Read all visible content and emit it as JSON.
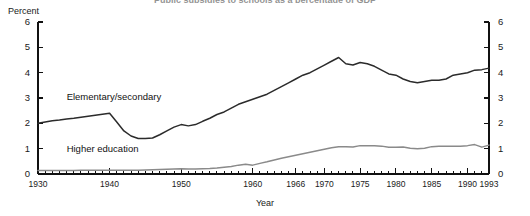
{
  "chart_data": {
    "type": "line",
    "title": "Public subsidies to schools as a percentage of GDP",
    "xlabel": "Year",
    "ylabel": "Percent",
    "ylim": [
      0,
      6
    ],
    "xlim": [
      1930,
      1993
    ],
    "grid": false,
    "legend_position": "inline-annotation",
    "yticks": [
      0,
      1,
      2,
      3,
      4,
      5,
      6
    ],
    "ytick_labels_left": [
      "0",
      "1",
      "2",
      "3",
      "4",
      "5",
      "6"
    ],
    "ytick_labels_right": [
      "0",
      "1",
      "2",
      "3",
      "4",
      "5",
      "6"
    ],
    "xticks": [
      1930,
      1940,
      1950,
      1960,
      1966,
      1970,
      1975,
      1980,
      1985,
      1990,
      1993
    ],
    "xtick_labels": [
      "1930",
      "1940",
      "1950",
      "1960",
      "1966",
      "1970",
      "1975",
      "1980",
      "1985",
      "1990",
      "1993"
    ],
    "x": [
      1930,
      1931,
      1932,
      1933,
      1934,
      1935,
      1936,
      1937,
      1938,
      1939,
      1940,
      1941,
      1942,
      1943,
      1944,
      1945,
      1946,
      1947,
      1948,
      1949,
      1950,
      1951,
      1952,
      1953,
      1954,
      1955,
      1956,
      1957,
      1958,
      1959,
      1960,
      1961,
      1962,
      1963,
      1964,
      1965,
      1966,
      1967,
      1968,
      1969,
      1970,
      1971,
      1972,
      1973,
      1974,
      1975,
      1976,
      1977,
      1978,
      1979,
      1980,
      1981,
      1982,
      1983,
      1984,
      1985,
      1986,
      1987,
      1988,
      1989,
      1990,
      1991,
      1992,
      1993
    ],
    "series": [
      {
        "name": "Elementary/secondary",
        "color": "#2b2b2b",
        "label_x": 1934,
        "label_y": 3.05,
        "values": [
          2.0,
          2.05,
          2.1,
          2.13,
          2.17,
          2.2,
          2.24,
          2.28,
          2.32,
          2.36,
          2.4,
          2.05,
          1.7,
          1.5,
          1.4,
          1.4,
          1.42,
          1.55,
          1.7,
          1.85,
          1.95,
          1.9,
          1.95,
          2.08,
          2.2,
          2.35,
          2.45,
          2.6,
          2.75,
          2.85,
          2.95,
          3.05,
          3.15,
          3.3,
          3.45,
          3.6,
          3.75,
          3.9,
          4.0,
          4.15,
          4.3,
          4.45,
          4.6,
          4.35,
          4.3,
          4.4,
          4.35,
          4.25,
          4.1,
          3.95,
          3.9,
          3.75,
          3.65,
          3.6,
          3.65,
          3.7,
          3.7,
          3.75,
          3.9,
          3.95,
          4.0,
          4.1,
          4.12,
          4.18
        ]
      },
      {
        "name": "Higher education",
        "color": "#8a8a8a",
        "label_x": 1934,
        "label_y": 1.0,
        "values": [
          0.14,
          0.14,
          0.14,
          0.14,
          0.14,
          0.14,
          0.15,
          0.15,
          0.15,
          0.15,
          0.15,
          0.15,
          0.15,
          0.15,
          0.15,
          0.16,
          0.17,
          0.18,
          0.19,
          0.2,
          0.21,
          0.2,
          0.2,
          0.21,
          0.22,
          0.24,
          0.27,
          0.3,
          0.35,
          0.38,
          0.35,
          0.42,
          0.48,
          0.55,
          0.62,
          0.68,
          0.74,
          0.8,
          0.86,
          0.92,
          0.98,
          1.04,
          1.08,
          1.08,
          1.07,
          1.12,
          1.12,
          1.12,
          1.1,
          1.06,
          1.06,
          1.07,
          1.02,
          1.0,
          1.02,
          1.08,
          1.1,
          1.1,
          1.1,
          1.1,
          1.12,
          1.16,
          1.06,
          1.14
        ]
      }
    ]
  }
}
